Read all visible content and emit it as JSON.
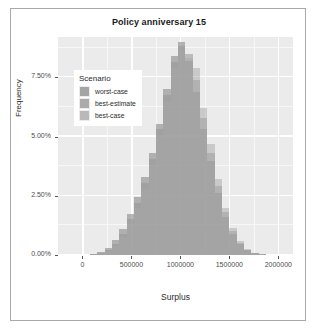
{
  "chart_data": {
    "type": "bar",
    "title": "Policy anniversary 15",
    "xlabel": "Surplus",
    "ylabel": "Frequency",
    "xlim": [
      -250000,
      2150000
    ],
    "ylim": [
      0,
      0.092
    ],
    "grid": true,
    "legend_position": "top-left-inside",
    "legend_title": "Scenario",
    "x_tick_labels": [
      "0",
      "500000",
      "1000000",
      "1500000",
      "2000000"
    ],
    "x_tick_values": [
      0,
      500000,
      1000000,
      1500000,
      2000000
    ],
    "y_tick_labels": [
      "0.00%",
      "2.50%",
      "5.00%",
      "7.50%"
    ],
    "y_tick_values": [
      0,
      0.025,
      0.05,
      0.075
    ],
    "bin_width": 75000,
    "bin_centers": [
      112500,
      187500,
      262500,
      337500,
      412500,
      487500,
      562500,
      637500,
      712500,
      787500,
      862500,
      937500,
      1012500,
      1087500,
      1162500,
      1237500,
      1312500,
      1387500,
      1462500,
      1537500,
      1612500,
      1687500,
      1762500,
      1837500
    ],
    "series": [
      {
        "name": "worst-case",
        "color": "#8c8c8c",
        "values": [
          0.0005,
          0.0012,
          0.003,
          0.0062,
          0.011,
          0.0175,
          0.0245,
          0.033,
          0.043,
          0.0555,
          0.07,
          0.084,
          0.09,
          0.082,
          0.069,
          0.053,
          0.0395,
          0.026,
          0.016,
          0.009,
          0.0045,
          0.002,
          0.0008,
          0.0003
        ]
      },
      {
        "name": "best-estimate",
        "color": "#969696",
        "values": [
          0.0003,
          0.0008,
          0.0022,
          0.0048,
          0.009,
          0.015,
          0.022,
          0.0305,
          0.0405,
          0.053,
          0.0675,
          0.0815,
          0.088,
          0.085,
          0.074,
          0.058,
          0.043,
          0.029,
          0.018,
          0.01,
          0.005,
          0.0022,
          0.0009,
          0.0003
        ]
      },
      {
        "name": "best-case",
        "color": "#a8a8a8",
        "values": [
          0.0002,
          0.0006,
          0.0016,
          0.0038,
          0.0075,
          0.013,
          0.02,
          0.028,
          0.038,
          0.05,
          0.0645,
          0.079,
          0.0865,
          0.083,
          0.079,
          0.062,
          0.047,
          0.032,
          0.02,
          0.0115,
          0.0058,
          0.0026,
          0.001,
          0.0004
        ]
      }
    ],
    "legend_entries": [
      {
        "label": "worst-case",
        "color": "#8c8c8c"
      },
      {
        "label": "best-estimate",
        "color": "#969696"
      },
      {
        "label": "best-case",
        "color": "#a8a8a8"
      }
    ],
    "panel_background": "#ebebeb",
    "plot_background": "#ffffff"
  }
}
